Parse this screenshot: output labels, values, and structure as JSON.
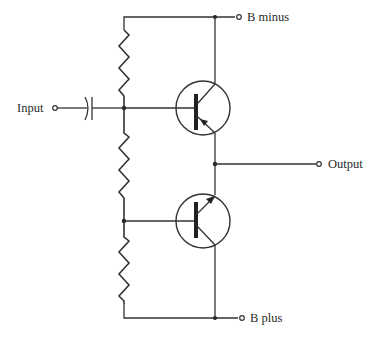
{
  "diagram": {
    "type": "circuit-schematic",
    "colors": {
      "line": "#333333",
      "background": "#ffffff",
      "text": "#2a2a2a"
    },
    "terminals": {
      "input": "Input",
      "output": "Output",
      "b_minus": "B minus",
      "b_plus": "B plus"
    },
    "components": [
      {
        "id": "C1",
        "kind": "capacitor",
        "between": [
          "Input",
          "bias-node-top"
        ]
      },
      {
        "id": "R1",
        "kind": "resistor",
        "between": [
          "B minus rail",
          "bias-node-top"
        ]
      },
      {
        "id": "R2",
        "kind": "resistor",
        "between": [
          "bias-node-top",
          "bias-node-bottom"
        ]
      },
      {
        "id": "R3",
        "kind": "resistor",
        "between": [
          "bias-node-bottom",
          "B plus rail"
        ]
      },
      {
        "id": "Q1",
        "kind": "transistor",
        "emitter_arrow": "inward (PNP)",
        "base": "bias-node-top",
        "collector": "B minus",
        "emitter": "Output"
      },
      {
        "id": "Q2",
        "kind": "transistor",
        "emitter_arrow": "outward (NPN)",
        "base": "bias-node-bottom",
        "emitter": "Output",
        "collector": "B plus"
      }
    ]
  }
}
